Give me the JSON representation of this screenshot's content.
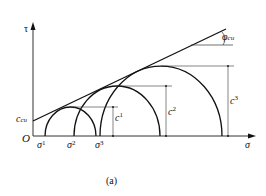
{
  "diagram": {
    "type": "mohr-circles-undrained",
    "axes": {
      "y_label": "τ",
      "x_label": "σ",
      "origin_label": "O"
    },
    "envelope": {
      "intercept_label": "c",
      "intercept_sub": "cu",
      "angle_label": "φ",
      "angle_sub": "cu"
    },
    "circles": [
      {
        "sigma_label": "σ",
        "sigma_sub": "3",
        "sigma_sup": "1",
        "cu_label": "c",
        "cu_sub": "u",
        "cu_sup": "1"
      },
      {
        "sigma_label": "σ",
        "sigma_sub": "3",
        "sigma_sup": "2",
        "cu_label": "c",
        "cu_sub": "u",
        "cu_sup": "2"
      },
      {
        "sigma_label": "σ",
        "sigma_sub": "3",
        "sigma_sup": "3",
        "cu_label": "c",
        "cu_sub": "u",
        "cu_sup": "3"
      }
    ],
    "caption": "(a)"
  }
}
